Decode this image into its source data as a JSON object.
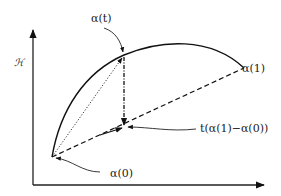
{
  "diagram": {
    "axis_label_y": "ℋ",
    "labels": {
      "alpha_t": "α(t)",
      "alpha_1": "α(1)",
      "alpha_0": "α(0)",
      "projection": "t(α(1)−α(0))"
    },
    "points": {
      "alpha_0": [
        52,
        157
      ],
      "alpha_t": [
        124,
        55
      ],
      "alpha_1": [
        244,
        68
      ],
      "projection_point": [
        124,
        127
      ]
    },
    "line_styles": {
      "curve": "solid",
      "alpha0_to_alpha1": "dashed",
      "alpha0_to_alphat": "dotted",
      "alphat_to_projection": "dash-dot"
    },
    "colors": {
      "stroke": "#111111",
      "background": "#ffffff"
    }
  }
}
